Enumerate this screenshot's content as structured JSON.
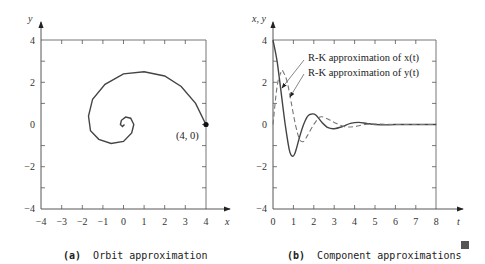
{
  "chart_data": [
    {
      "type": "line",
      "title": "Orbit approximation",
      "panel_label": "(a)",
      "xlabel": "x",
      "ylabel": "y",
      "xlim": [
        -4,
        4
      ],
      "ylim": [
        -4,
        4
      ],
      "x_ticks": [
        "-4",
        "-3",
        "-2",
        "-1",
        "0",
        "1",
        "2",
        "3",
        "4"
      ],
      "y_ticks": [
        "4",
        "2",
        "0",
        "-2",
        "-4"
      ],
      "grid": false,
      "annotation": "(4, 0)",
      "series": [
        {
          "name": "orbit",
          "style": "solid",
          "x": [
            4.0,
            3.5,
            2.8,
            2.0,
            1.0,
            0.0,
            -0.9,
            -1.5,
            -1.7,
            -1.6,
            -1.2,
            -0.6,
            0.0,
            0.4,
            0.5,
            0.35,
            0.1,
            -0.1,
            -0.15,
            -0.05,
            0.05
          ],
          "y": [
            0.0,
            1.0,
            1.8,
            2.3,
            2.5,
            2.4,
            1.9,
            1.2,
            0.4,
            -0.3,
            -0.7,
            -0.9,
            -0.8,
            -0.4,
            0.0,
            0.3,
            0.35,
            0.2,
            0.0,
            -0.1,
            0.0
          ]
        }
      ]
    },
    {
      "type": "line",
      "title": "Component approximations",
      "panel_label": "(b)",
      "xlabel": "t",
      "ylabel": "x, y",
      "xlim": [
        0,
        8
      ],
      "ylim": [
        -4,
        4
      ],
      "x_ticks": [
        "0",
        "1",
        "2",
        "3",
        "4",
        "5",
        "6",
        "7",
        "8"
      ],
      "y_ticks": [
        "4",
        "2",
        "0",
        "-2",
        "-4"
      ],
      "grid": false,
      "legend": [
        "R-K approximation of x(t)",
        "R-K approximation of y(t)"
      ],
      "series": [
        {
          "name": "R-K approximation of x(t)",
          "style": "solid",
          "x": [
            0,
            0.2,
            0.4,
            0.6,
            0.8,
            0.95,
            1.1,
            1.3,
            1.5,
            1.7,
            1.9,
            2.1,
            2.4,
            2.7,
            3.0,
            3.4,
            3.8,
            4.2,
            4.6,
            5.0,
            5.5,
            6,
            7,
            8
          ],
          "y": [
            4.0,
            3.0,
            1.5,
            0.0,
            -1.2,
            -1.5,
            -1.3,
            -0.6,
            0.0,
            0.4,
            0.5,
            0.45,
            0.1,
            -0.15,
            -0.2,
            -0.1,
            0.05,
            0.1,
            0.05,
            0.0,
            -0.02,
            0.0,
            0.0,
            0.0
          ]
        },
        {
          "name": "R-K approximation of y(t)",
          "style": "dashed",
          "x": [
            0,
            0.2,
            0.4,
            0.5,
            0.7,
            0.9,
            1.1,
            1.3,
            1.5,
            1.7,
            2.0,
            2.3,
            2.6,
            3.0,
            3.5,
            4.0,
            4.5,
            5.0,
            6,
            7,
            8
          ],
          "y": [
            0.0,
            1.8,
            2.5,
            2.5,
            2.0,
            1.0,
            0.0,
            -0.7,
            -0.8,
            -0.5,
            0.0,
            0.35,
            0.3,
            0.1,
            -0.1,
            -0.1,
            0.0,
            0.02,
            0.0,
            0.0,
            0.0
          ]
        }
      ]
    }
  ],
  "captions": {
    "a_label": "(a)",
    "a_text": "Orbit approximation",
    "b_label": "(b)",
    "b_text": "Component approximations"
  },
  "labels": {
    "left_y": "y",
    "left_x": "x",
    "right_y": "x, y",
    "right_x": "t",
    "point": "(4, 0)",
    "legend_x": "R-K approximation of x(t)",
    "legend_y": "R-K approximation of y(t)"
  }
}
